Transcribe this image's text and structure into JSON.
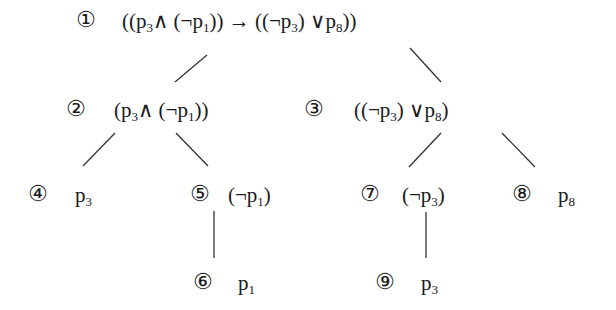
{
  "diagram": {
    "type": "parse-tree",
    "nodes": [
      {
        "id": "1",
        "label": "①",
        "formula_parts": [
          "((p",
          "3",
          "∧  (¬p",
          "1",
          "))  →  ((¬p",
          "3",
          ")  ∨p",
          "8",
          "))"
        ]
      },
      {
        "id": "2",
        "label": "②",
        "formula_parts": [
          "(p",
          "3",
          "∧  (¬p",
          "1",
          "))"
        ]
      },
      {
        "id": "3",
        "label": "③",
        "formula_parts": [
          "((¬p",
          "3",
          ")  ∨p",
          "8",
          ")"
        ]
      },
      {
        "id": "4",
        "label": "④",
        "formula_parts": [
          "p",
          "3"
        ]
      },
      {
        "id": "5",
        "label": "⑤",
        "formula_parts": [
          "(¬p",
          "1",
          ")"
        ]
      },
      {
        "id": "6",
        "label": "⑥",
        "formula_parts": [
          "p",
          "1"
        ]
      },
      {
        "id": "7",
        "label": "⑦",
        "formula_parts": [
          "(¬p",
          "3",
          ")"
        ]
      },
      {
        "id": "8",
        "label": "⑧",
        "formula_parts": [
          "p",
          "8"
        ]
      },
      {
        "id": "9",
        "label": "⑨",
        "formula_parts": [
          "p",
          "3"
        ]
      }
    ],
    "edges": [
      {
        "from": "1",
        "to": "2"
      },
      {
        "from": "1",
        "to": "3"
      },
      {
        "from": "2",
        "to": "4"
      },
      {
        "from": "2",
        "to": "5"
      },
      {
        "from": "3",
        "to": "7"
      },
      {
        "from": "3",
        "to": "8"
      },
      {
        "from": "5",
        "to": "6"
      },
      {
        "from": "7",
        "to": "9"
      }
    ],
    "line_color": "#333333"
  }
}
